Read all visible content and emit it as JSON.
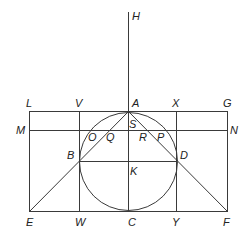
{
  "diagram": {
    "type": "geometric-construction",
    "colors": {
      "stroke": "#3a3a3a",
      "text": "#222222",
      "background": "#ffffff"
    },
    "labels": {
      "H": "H",
      "L": "L",
      "V": "V",
      "A": "A",
      "X": "X",
      "G": "G",
      "M": "M",
      "N": "N",
      "O": "O",
      "Q": "Q",
      "S": "S",
      "R": "R",
      "P": "P",
      "B": "B",
      "D": "D",
      "K": "K",
      "E": "E",
      "W": "W",
      "C": "C",
      "Y": "Y",
      "F": "F"
    }
  }
}
